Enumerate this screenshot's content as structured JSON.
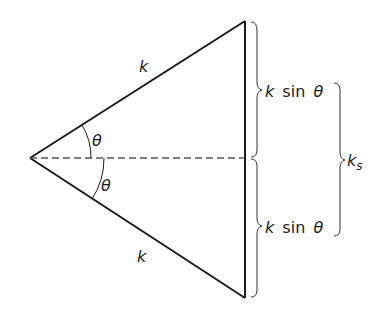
{
  "diagram": {
    "type": "geometric-triangle",
    "sides": {
      "upper": {
        "label": "k"
      },
      "lower": {
        "label": "k"
      }
    },
    "angles": {
      "upper": {
        "label": "θ"
      },
      "lower": {
        "label": "θ"
      }
    },
    "braces": {
      "upper_half": {
        "label_var": "k",
        "label_func": "sin",
        "label_arg": "θ"
      },
      "lower_half": {
        "label_var": "k",
        "label_func": "sin",
        "label_arg": "θ"
      },
      "total": {
        "label_base": "k",
        "label_sub": "s"
      }
    },
    "colors": {
      "stroke": "#1a1a1a",
      "dashed": "#555555"
    }
  }
}
